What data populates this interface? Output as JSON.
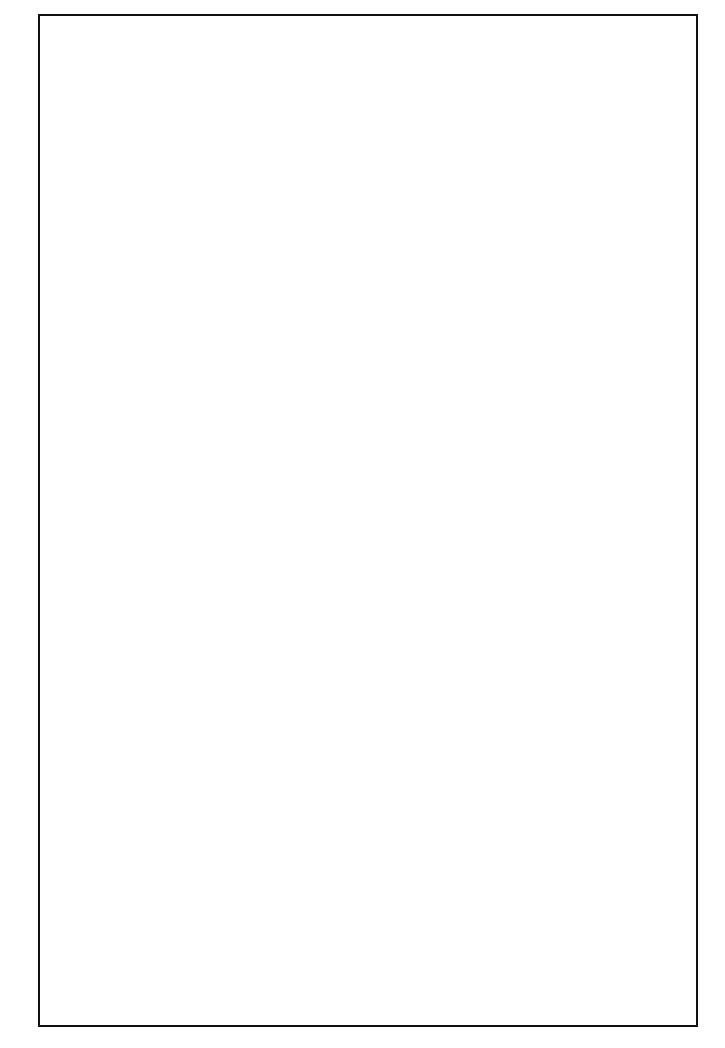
{
  "figure": {
    "subtitle": "Baltimore 2000"
  },
  "chart_data": [
    {
      "type": "bar",
      "panel": "top",
      "title": "Income Distributions in Neighborhoods with 75%+ Black and White Population",
      "subtitle": "Baltimore 2000",
      "group_label": "Black (N=104)",
      "xlabel": "Per capita income (in thousands of $)",
      "ylabel": "Number of Baltimore tracts",
      "xlim": [
        0,
        72
      ],
      "ylim": [
        0,
        33
      ],
      "xticks": [
        0,
        10,
        20,
        30,
        40,
        50,
        60,
        70
      ],
      "xtick_labels": [
        "0",
        "10",
        "20",
        "30",
        "40",
        "50",
        "60",
        "70"
      ],
      "xminor_ticks": [
        5,
        15,
        25,
        35,
        45,
        55,
        65
      ],
      "yticks": [
        0,
        10,
        20,
        30
      ],
      "ytick_labels": [
        "0",
        "10",
        "20",
        "30"
      ],
      "yminor_ticks": [
        5,
        15,
        25
      ],
      "grid": false,
      "bin_width": 2.5,
      "bins": [
        {
          "start": 2.5,
          "end": 5.0,
          "count": 1
        },
        {
          "start": 5.0,
          "end": 7.5,
          "count": 3
        },
        {
          "start": 7.5,
          "end": 10.0,
          "count": 22
        },
        {
          "start": 10.0,
          "end": 12.5,
          "count": 31
        },
        {
          "start": 12.5,
          "end": 15.0,
          "count": 24
        },
        {
          "start": 15.0,
          "end": 17.5,
          "count": 15
        },
        {
          "start": 17.5,
          "end": 20.0,
          "count": 8
        },
        {
          "start": 22.5,
          "end": 25.0,
          "count": 1
        },
        {
          "start": 25.0,
          "end": 27.5,
          "count": 1
        }
      ],
      "reference_line": {
        "x": 12.5,
        "style": "dashed",
        "color": "#111111"
      }
    },
    {
      "type": "bar",
      "panel": "bottom",
      "group_label": "White (N=34)",
      "xlabel": "Per capita income (in thousands of $)",
      "ylabel": "Number of Baltimore tracts",
      "xlim": [
        0,
        72
      ],
      "ylim": [
        0,
        33
      ],
      "xticks": [
        0,
        10,
        20,
        30,
        40,
        50,
        60,
        70
      ],
      "xtick_labels": [
        "0",
        "10",
        "20",
        "30",
        "40",
        "50",
        "60",
        "70"
      ],
      "xminor_ticks": [
        5,
        15,
        25,
        35,
        45,
        55,
        65
      ],
      "yticks": [
        0,
        10,
        20,
        30
      ],
      "ytick_labels": [
        "0",
        "10",
        "20",
        "30"
      ],
      "yminor_ticks": [
        5,
        15,
        25
      ],
      "grid": false,
      "bin_width": 2.5,
      "bins": [
        {
          "start": 13.0,
          "end": 15.5,
          "count": 3
        },
        {
          "start": 15.5,
          "end": 18.0,
          "count": 9
        },
        {
          "start": 18.0,
          "end": 20.5,
          "count": 3
        },
        {
          "start": 20.5,
          "end": 23.0,
          "count": 2
        },
        {
          "start": 23.0,
          "end": 25.5,
          "count": 2
        },
        {
          "start": 25.5,
          "end": 28.0,
          "count": 3
        },
        {
          "start": 28.0,
          "end": 30.5,
          "count": 2
        },
        {
          "start": 35.5,
          "end": 38.0,
          "count": 2
        },
        {
          "start": 40.5,
          "end": 43.0,
          "count": 4
        },
        {
          "start": 43.0,
          "end": 45.5,
          "count": 1
        },
        {
          "start": 45.5,
          "end": 48.0,
          "count": 1
        },
        {
          "start": 55.5,
          "end": 58.0,
          "count": 1
        },
        {
          "start": 63.0,
          "end": 65.5,
          "count": 1
        }
      ],
      "reference_line": {
        "x": 12.5,
        "style": "dashed",
        "color": "#111111"
      }
    }
  ]
}
